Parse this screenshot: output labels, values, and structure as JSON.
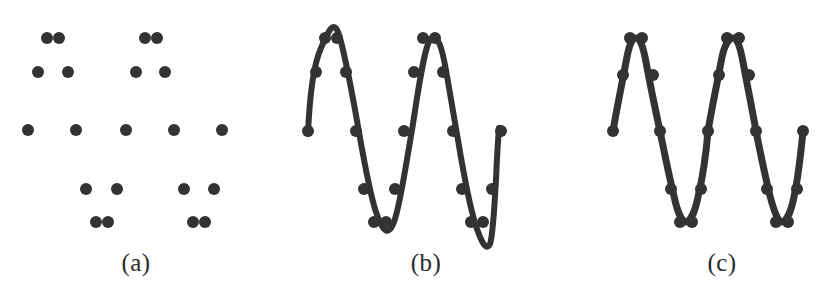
{
  "figure": {
    "background_color": "#ffffff",
    "ink_color": "#333333",
    "width": 832,
    "height": 302
  },
  "panels": [
    {
      "id": "a",
      "caption": "(a)",
      "description": "Scattered data points only, no fitted curve",
      "dot_radius": 6,
      "points": [
        {
          "x": 47,
          "y": 38
        },
        {
          "x": 59,
          "y": 38
        },
        {
          "x": 38,
          "y": 72
        },
        {
          "x": 68,
          "y": 72
        },
        {
          "x": 145,
          "y": 38
        },
        {
          "x": 157,
          "y": 38
        },
        {
          "x": 136,
          "y": 72
        },
        {
          "x": 165,
          "y": 72
        },
        {
          "x": 28,
          "y": 130
        },
        {
          "x": 76,
          "y": 130
        },
        {
          "x": 126,
          "y": 130
        },
        {
          "x": 174,
          "y": 130
        },
        {
          "x": 222,
          "y": 130
        },
        {
          "x": 86,
          "y": 189
        },
        {
          "x": 117,
          "y": 189
        },
        {
          "x": 184,
          "y": 189
        },
        {
          "x": 214,
          "y": 189
        },
        {
          "x": 96,
          "y": 222
        },
        {
          "x": 108,
          "y": 222
        },
        {
          "x": 193,
          "y": 222
        },
        {
          "x": 205,
          "y": 222
        }
      ]
    },
    {
      "id": "b",
      "caption": "(b)",
      "description": "Overfitted wiggly curve that overshoots peaks and troughs",
      "dot_radius": 6,
      "stroke_width": 6,
      "points": [
        {
          "x": 30,
          "y": 131
        },
        {
          "x": 47,
          "y": 38
        },
        {
          "x": 59,
          "y": 38
        },
        {
          "x": 38,
          "y": 72
        },
        {
          "x": 68,
          "y": 72
        },
        {
          "x": 78,
          "y": 131
        },
        {
          "x": 86,
          "y": 189
        },
        {
          "x": 117,
          "y": 189
        },
        {
          "x": 96,
          "y": 222
        },
        {
          "x": 108,
          "y": 222
        },
        {
          "x": 126,
          "y": 131
        },
        {
          "x": 145,
          "y": 38
        },
        {
          "x": 157,
          "y": 38
        },
        {
          "x": 136,
          "y": 72
        },
        {
          "x": 165,
          "y": 72
        },
        {
          "x": 175,
          "y": 131
        },
        {
          "x": 184,
          "y": 189
        },
        {
          "x": 214,
          "y": 189
        },
        {
          "x": 193,
          "y": 222
        },
        {
          "x": 205,
          "y": 222
        },
        {
          "x": 223,
          "y": 131
        }
      ],
      "curve": "M 30,134 C 31,110 33,70 43,48 C 50,32 55,20 60,32 C 64,42 70,72 76,104 C 84,148 90,188 98,212 C 104,230 110,238 116,222 C 122,206 127,170 134,130 C 140,92 146,48 152,40 C 157,33 162,40 166,60 C 170,80 174,106 180,140 C 186,176 192,208 198,226 C 203,241 208,252 212,244 C 215,236 216,212 218,180 C 219,156 220,140 221,128"
    },
    {
      "id": "c",
      "caption": "(c)",
      "description": "Smooth sinusoidal curve passing through every data point",
      "dot_radius": 6,
      "stroke_width": 7,
      "points": [
        {
          "x": 57,
          "y": 131
        },
        {
          "x": 67,
          "y": 75
        },
        {
          "x": 74,
          "y": 38
        },
        {
          "x": 86,
          "y": 38
        },
        {
          "x": 97,
          "y": 75
        },
        {
          "x": 104,
          "y": 131
        },
        {
          "x": 115,
          "y": 189
        },
        {
          "x": 124,
          "y": 222
        },
        {
          "x": 136,
          "y": 222
        },
        {
          "x": 145,
          "y": 189
        },
        {
          "x": 152,
          "y": 131
        },
        {
          "x": 163,
          "y": 75
        },
        {
          "x": 171,
          "y": 38
        },
        {
          "x": 183,
          "y": 38
        },
        {
          "x": 193,
          "y": 75
        },
        {
          "x": 200,
          "y": 131
        },
        {
          "x": 211,
          "y": 189
        },
        {
          "x": 220,
          "y": 222
        },
        {
          "x": 232,
          "y": 222
        },
        {
          "x": 241,
          "y": 189
        },
        {
          "x": 247,
          "y": 131
        }
      ],
      "curve": "M 57,131 C 62,102 66,84 70,62 C 73,45 76,38 80,38 C 84,38 87,46 90,62 C 94,84 99,108 104,131 C 109,156 113,176 118,196 C 121,211 126,222 130,222 C 134,222 139,212 142,197 C 147,176 150,156 152,131 C 157,102 161,84 165,62 C 168,45 173,38 177,38 C 181,38 184,46 187,62 C 191,84 196,108 200,131 C 205,156 209,176 214,196 C 218,211 222,222 226,222 C 230,222 235,212 238,197 C 242,178 245,152 247,131"
    }
  ]
}
